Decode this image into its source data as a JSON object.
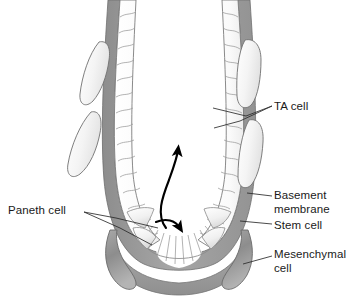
{
  "figure": {
    "name": "intestinal-crypt-diagram",
    "background_color": "#ffffff"
  },
  "labels": {
    "ta_cell": "TA cell",
    "basement_membrane": "Basement\nmembrane",
    "stem_cell": "Stem cell",
    "mesenchymal_cell": "Mesenchymal\ncell",
    "paneth_cell": "Paneth cell"
  },
  "colors": {
    "text": "#1a1a1a",
    "leader_line": "#2b2b2b",
    "outline": "#595959",
    "cell_outline": "#8c8c8c",
    "basement_membrane_fill": "#a0a0a0",
    "basement_membrane_dark": "#8a8a8a",
    "mesenchymal_light_fill": "#f2f2f2",
    "mesenchymal_dark_fill": "#8f8f8f",
    "epithelium_fill": "#fbfbfb",
    "lumen_fill": "#ffffff",
    "arrow": "#000000"
  },
  "structures": {
    "lumen": "crypt-lumen",
    "left_wall": "epithelial-column-left",
    "right_wall": "epithelial-column-right",
    "basement_membrane": "basement-membrane-layer",
    "stem_cell_zone": "stem-cell-wedge-zone",
    "paneth_zone": "paneth-cell-zone",
    "migration_arrow": "upward-migration-arrow",
    "division_arrow": "downward-division-arrow"
  },
  "counts": {
    "mesenchymal_cells_left": 2,
    "mesenchymal_cells_right": 2,
    "mesenchymal_crescents_bottom": 2,
    "stem_cell_wedges": 11
  }
}
